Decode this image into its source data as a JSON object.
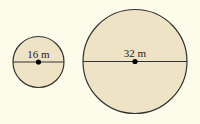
{
  "diagram": {
    "background": "#fdfbe9",
    "fill_color": "#efe3c6",
    "stroke_color": "#333333",
    "circles": [
      {
        "label": "16 m",
        "diameter": 16,
        "unit": "m",
        "cx": 38.5,
        "cy": 62,
        "r": 25.5
      },
      {
        "label": "32 m",
        "diameter": 32,
        "unit": "m",
        "cx": 135,
        "cy": 61.5,
        "r": 52
      }
    ]
  }
}
